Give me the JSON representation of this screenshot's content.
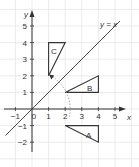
{
  "chart_data": {
    "type": "diagram",
    "title": "",
    "xlabel": "x",
    "ylabel": "y",
    "xlim": [
      -1.9,
      5.8
    ],
    "ylim": [
      -2.7,
      5.9
    ],
    "x_ticks": [
      -1,
      0,
      1,
      2,
      3,
      4,
      5
    ],
    "y_ticks": [
      -2,
      -1,
      1,
      2,
      3,
      4,
      5
    ],
    "x_tick_labels": [
      "−1",
      "0",
      "1",
      "2",
      "3",
      "4",
      "5"
    ],
    "y_tick_labels": [
      "−2",
      "−1",
      "1",
      "2",
      "3",
      "4",
      "5"
    ],
    "grid": true,
    "line": {
      "label": "y = x",
      "from": [
        -1.6,
        -1.6
      ],
      "to": [
        5.3,
        5.3
      ]
    },
    "shapes": [
      {
        "name": "A",
        "vertices": [
          [
            2,
            -1
          ],
          [
            4,
            -1
          ],
          [
            4,
            -2
          ]
        ],
        "label_pos": [
          3.4,
          -1.5
        ]
      },
      {
        "name": "B",
        "vertices": [
          [
            2,
            1
          ],
          [
            4,
            1
          ],
          [
            4,
            2
          ]
        ],
        "label_pos": [
          3.4,
          1.35
        ]
      },
      {
        "name": "C",
        "vertices": [
          [
            1,
            4
          ],
          [
            2,
            4
          ],
          [
            1,
            2
          ]
        ],
        "label_pos": [
          1.3,
          3.4
        ]
      }
    ],
    "arc": {
      "center": [
        0,
        0
      ],
      "radius": 2.3,
      "style": "dashed",
      "arrow_end": "upper-left"
    }
  },
  "labels": {
    "line_label": "y = x",
    "x_axis": "x",
    "y_axis": "y",
    "shape_a": "A",
    "shape_b": "B",
    "shape_c": "C",
    "x_ticks": [
      "−1",
      "0",
      "1",
      "2",
      "3",
      "4",
      "5"
    ],
    "y_ticks": [
      "−2",
      "−1",
      "1",
      "2",
      "3",
      "4",
      "5"
    ]
  },
  "colors": {
    "axis": "#333333",
    "grid": "#e6e6e6",
    "shape_stroke": "#333333",
    "line": "#333333",
    "arc": "#999999"
  }
}
